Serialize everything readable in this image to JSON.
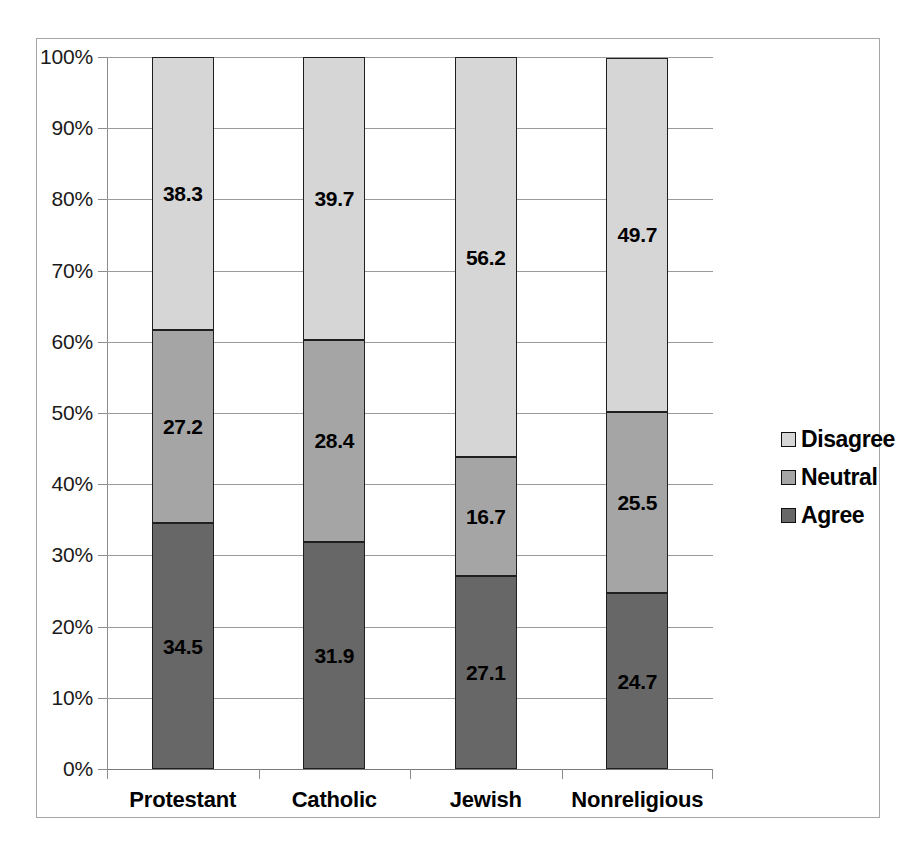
{
  "chart_data": {
    "type": "bar",
    "stacked": true,
    "stack_mode": "percent",
    "title": "",
    "subtitle": "",
    "xlabel": "",
    "ylabel": "",
    "categories": [
      "Protestant",
      "Catholic",
      "Jewish",
      "Nonreligious"
    ],
    "series": [
      {
        "name": "Disagree",
        "color": "#d6d6d6",
        "values": [
          38.3,
          39.7,
          56.2,
          49.7
        ],
        "labels": [
          "38.3",
          "39.7",
          "56.2",
          "49.7"
        ]
      },
      {
        "name": "Neutral",
        "color": "#a5a5a5",
        "values": [
          27.2,
          28.4,
          16.7,
          25.5
        ],
        "labels": [
          "27.2",
          "28.4",
          "16.7",
          "25.5"
        ]
      },
      {
        "name": "Agree",
        "color": "#676767",
        "values": [
          34.5,
          31.9,
          27.1,
          24.7
        ],
        "labels": [
          "34.5",
          "31.9",
          "27.1",
          "24.7"
        ]
      }
    ],
    "stack_order_bottom_to_top": [
      "Agree",
      "Neutral",
      "Disagree"
    ],
    "ylim": [
      0,
      100
    ],
    "ytick_values": [
      0,
      10,
      20,
      30,
      40,
      50,
      60,
      70,
      80,
      90,
      100
    ],
    "ytick_labels": [
      "0%",
      "10%",
      "20%",
      "30%",
      "40%",
      "50%",
      "60%",
      "70%",
      "80%",
      "90%",
      "100%"
    ],
    "grid": true,
    "grid_color": "#9b9b9b",
    "legend_position": "right",
    "legend": [
      {
        "label": "Disagree",
        "color": "#d6d6d6"
      },
      {
        "label": "Neutral",
        "color": "#a5a5a5"
      },
      {
        "label": "Agree",
        "color": "#676767"
      }
    ],
    "bar_border_color": "#1f1f1f",
    "plot_background": "#ffffff",
    "frame_border_color": "#a6a6a6"
  }
}
